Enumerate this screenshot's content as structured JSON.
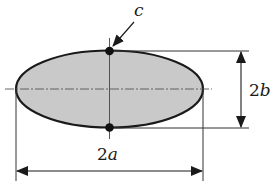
{
  "diagram": {
    "type": "ellipse-dimension-diagram",
    "shape": {
      "name": "ellipse",
      "fill_color": "#c9c9c9",
      "stroke_color": "#1a1a1a"
    },
    "labels": {
      "point": {
        "text": "c",
        "var": "c"
      },
      "major_axis": {
        "text": "2a",
        "num": "2",
        "var": "a"
      },
      "minor_axis": {
        "text": "2b",
        "num": "2",
        "var": "b"
      }
    },
    "points": [
      {
        "name": "top-vertex",
        "role": "point c"
      },
      {
        "name": "bottom-vertex"
      }
    ],
    "colors": {
      "line": "#1a1a1a",
      "thin_line": "#555555",
      "fill": "#c9c9c9"
    }
  }
}
